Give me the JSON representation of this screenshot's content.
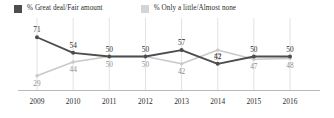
{
  "legend": {
    "series": [
      {
        "label": "% Great deal/Fair amount",
        "swatch": "dark-swatch-icon",
        "color": "#4d4d4d"
      },
      {
        "label": "% Only a little/Almost none",
        "swatch": "light-swatch-icon",
        "color": "#d5d5d5"
      }
    ]
  },
  "chart_data": {
    "type": "line",
    "title": "",
    "xlabel": "",
    "ylabel": "",
    "categories": [
      "2009",
      "2010",
      "2011",
      "2012",
      "2013",
      "2014",
      "2015",
      "2016"
    ],
    "ylim": [
      20,
      80
    ],
    "grid": "vertical",
    "legend_position": "top-left",
    "series": [
      {
        "name": "% Great deal/Fair amount",
        "color": "#4d4d4d",
        "values": [
          71,
          54,
          50,
          50,
          57,
          42,
          50,
          50
        ],
        "labels": [
          "71",
          "54",
          "50",
          "50",
          "57",
          "42",
          "50",
          "50"
        ]
      },
      {
        "name": "% Only a little/Almost none",
        "color": "#c9c9c9",
        "values": [
          29,
          44,
          50,
          50,
          42,
          57,
          47,
          48
        ],
        "labels": [
          "29",
          "44",
          "50",
          "50",
          "42",
          "57",
          "47",
          "48"
        ]
      }
    ]
  },
  "axis": {
    "x_ticks": [
      "2009",
      "2010",
      "2011",
      "2012",
      "2013",
      "2014",
      "2015",
      "2016"
    ]
  }
}
